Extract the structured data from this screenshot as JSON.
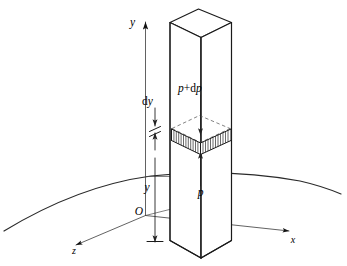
{
  "figure": {
    "background_color": "#ffffff",
    "line_color": "#1a1a1a",
    "labels": {
      "axis_y": "y",
      "axis_x": "x",
      "axis_z": "z",
      "origin": "O",
      "height_y": "y",
      "thickness_dy_d": "d",
      "thickness_dy_y": "y",
      "pressure_bottom": "p",
      "pressure_top_p": "p",
      "pressure_top_plus": "+",
      "pressure_top_d": "d",
      "pressure_top_p2": "p",
      "pressure_top_full": "p+dp"
    },
    "elements": {
      "column": "rectangular-vertical-column",
      "slab": "hatched-thin-slab-element",
      "ground": "curved-earth-surface-arc",
      "axes": "three-dimensional-cartesian-axes"
    }
  }
}
